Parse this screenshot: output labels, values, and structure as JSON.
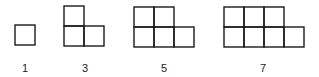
{
  "figure": {
    "cell_size": 20,
    "stroke_color": "#1a1a1a",
    "items": [
      {
        "label": "1",
        "origin_x": 15,
        "bottom_y": 45,
        "bottom_row_cells": 1,
        "top_row_cells": 0,
        "label_x": 25
      },
      {
        "label": "3",
        "origin_x": 64,
        "bottom_y": 46,
        "bottom_row_cells": 2,
        "top_row_cells": 1,
        "label_x": 85
      },
      {
        "label": "5",
        "origin_x": 134,
        "bottom_y": 47,
        "bottom_row_cells": 3,
        "top_row_cells": 2,
        "label_x": 164
      },
      {
        "label": "7",
        "origin_x": 224,
        "bottom_y": 47,
        "bottom_row_cells": 4,
        "top_row_cells": 3,
        "label_x": 263
      }
    ],
    "label_y": 72
  }
}
